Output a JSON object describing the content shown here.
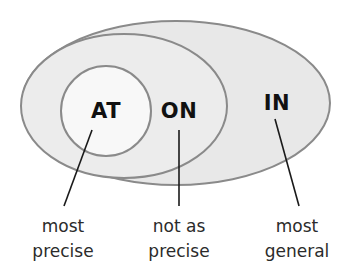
{
  "diagram": {
    "type": "nested-venn-ellipses",
    "canvas": {
      "width": 353,
      "height": 278,
      "background": "#ffffff"
    },
    "colors": {
      "outer_fill": "#e8e8e8",
      "middle_fill": "#ececec",
      "inner_fill": "#f8f8f8",
      "stroke": "#8a8a8a",
      "label_text": "#111111",
      "caption_text": "#2b2b2b",
      "leader_line": "#1a1a1a"
    },
    "regions": [
      {
        "id": "at",
        "label": "AT",
        "caption_line1": "most",
        "caption_line2": "precise",
        "fill": "#f8f8f8",
        "ellipse": {
          "cx": 106,
          "cy": 111,
          "rx": 45,
          "ry": 45
        },
        "label_pos": {
          "x": 106,
          "y": 118
        },
        "caption_pos": {
          "x": 63,
          "y": 232
        },
        "leader": {
          "x1": 92,
          "y1": 130,
          "x2": 64,
          "y2": 206
        }
      },
      {
        "id": "on",
        "label": "ON",
        "caption_line1": "not as",
        "caption_line2": "precise",
        "fill": "#ececec",
        "ellipse": {
          "cx": 124,
          "cy": 106,
          "rx": 103,
          "ry": 72
        },
        "label_pos": {
          "x": 179,
          "y": 118
        },
        "caption_pos": {
          "x": 179,
          "y": 232
        },
        "leader": {
          "x1": 179,
          "y1": 130,
          "x2": 179,
          "y2": 206
        }
      },
      {
        "id": "in",
        "label": "IN",
        "caption_line1": "most",
        "caption_line2": "general",
        "fill": "#e8e8e8",
        "ellipse": {
          "cx": 176,
          "cy": 103,
          "rx": 154,
          "ry": 82
        },
        "label_pos": {
          "x": 277,
          "y": 110
        },
        "caption_pos": {
          "x": 297,
          "y": 232
        },
        "leader": {
          "x1": 275,
          "y1": 119,
          "x2": 299,
          "y2": 206
        }
      }
    ],
    "caption_line_height": 25
  }
}
